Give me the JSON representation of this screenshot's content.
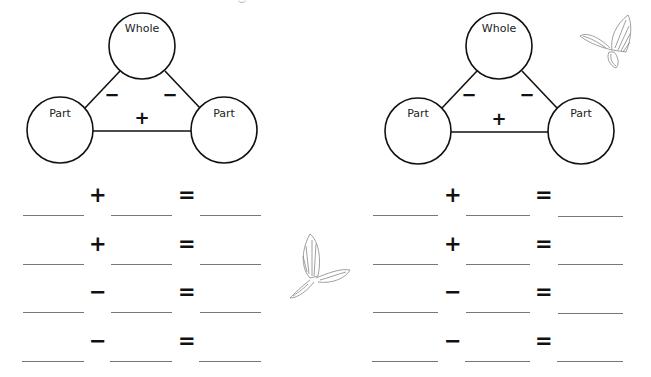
{
  "worksheet": {
    "diagrams": [
      {
        "whole_label": "Whole",
        "part_left_label": "Part",
        "part_right_label": "Part",
        "edge_left_sign": "−",
        "edge_right_sign": "−",
        "edge_bottom_sign": "+"
      },
      {
        "whole_label": "Whole",
        "part_left_label": "Part",
        "part_right_label": "Part",
        "edge_left_sign": "−",
        "edge_right_sign": "−",
        "edge_bottom_sign": "+"
      }
    ],
    "equation_columns": [
      {
        "rows": [
          {
            "operator": "+",
            "equals": "=",
            "blank1": "",
            "blank2": "",
            "blank3": ""
          },
          {
            "operator": "+",
            "equals": "=",
            "blank1": "",
            "blank2": "",
            "blank3": ""
          },
          {
            "operator": "−",
            "equals": "=",
            "blank1": "",
            "blank2": "",
            "blank3": ""
          },
          {
            "operator": "−",
            "equals": "=",
            "blank1": "",
            "blank2": "",
            "blank3": ""
          }
        ]
      },
      {
        "rows": [
          {
            "operator": "+",
            "equals": "=",
            "blank1": "",
            "blank2": "",
            "blank3": ""
          },
          {
            "operator": "+",
            "equals": "=",
            "blank1": "",
            "blank2": "",
            "blank3": ""
          },
          {
            "operator": "−",
            "equals": "=",
            "blank1": "",
            "blank2": "",
            "blank3": ""
          },
          {
            "operator": "−",
            "equals": "=",
            "blank1": "",
            "blank2": "",
            "blank3": ""
          }
        ]
      }
    ],
    "decorations": [
      {
        "icon": "butterfly-icon",
        "position": "top-right"
      },
      {
        "icon": "butterfly-icon",
        "position": "middle"
      }
    ]
  }
}
